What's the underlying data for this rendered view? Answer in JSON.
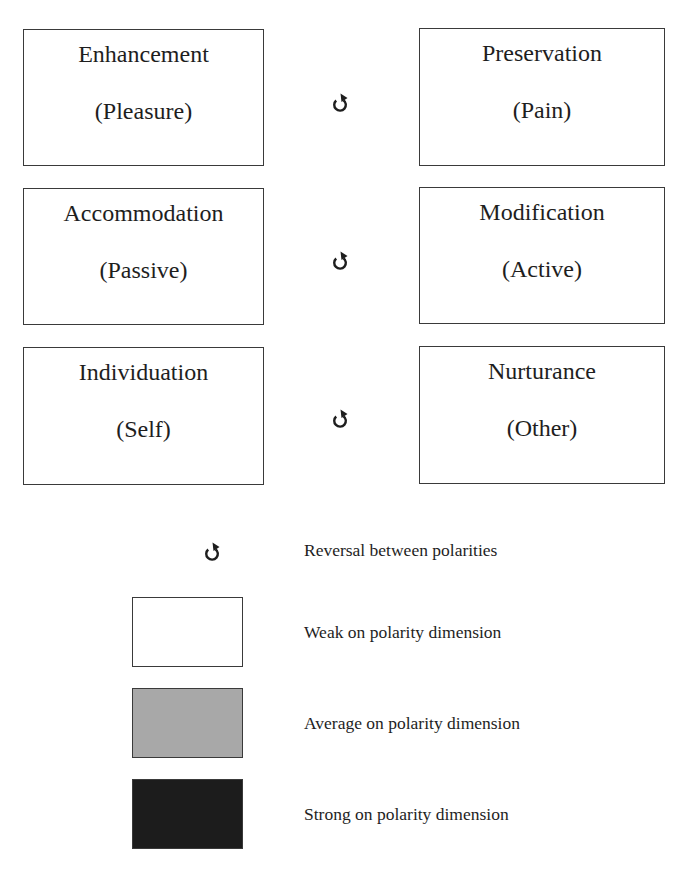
{
  "pairs": [
    {
      "left": {
        "title": "Enhancement",
        "subtitle": "(Pleasure)"
      },
      "right": {
        "title": "Preservation",
        "subtitle": "(Pain)"
      },
      "connector_icon": "reversal-icon"
    },
    {
      "left": {
        "title": "Accommodation",
        "subtitle": "(Passive)"
      },
      "right": {
        "title": "Modification",
        "subtitle": "(Active)"
      },
      "connector_icon": "reversal-icon"
    },
    {
      "left": {
        "title": "Individuation",
        "subtitle": "(Self)"
      },
      "right": {
        "title": "Nurturance",
        "subtitle": "(Other)"
      },
      "connector_icon": "reversal-icon"
    }
  ],
  "legend": {
    "items": [
      {
        "icon": "reversal-icon",
        "label": "Reversal between polarities"
      },
      {
        "swatch_color": "#ffffff",
        "label": "Weak on polarity dimension"
      },
      {
        "swatch_color": "#a8a8a8",
        "label": "Average on polarity dimension"
      },
      {
        "swatch_color": "#1c1c1c",
        "label": "Strong on polarity dimension"
      }
    ]
  },
  "colors": {
    "weak": "#ffffff",
    "average": "#a8a8a8",
    "strong": "#1c1c1c",
    "border": "#3a3a3a",
    "text": "#1e1e1e"
  }
}
